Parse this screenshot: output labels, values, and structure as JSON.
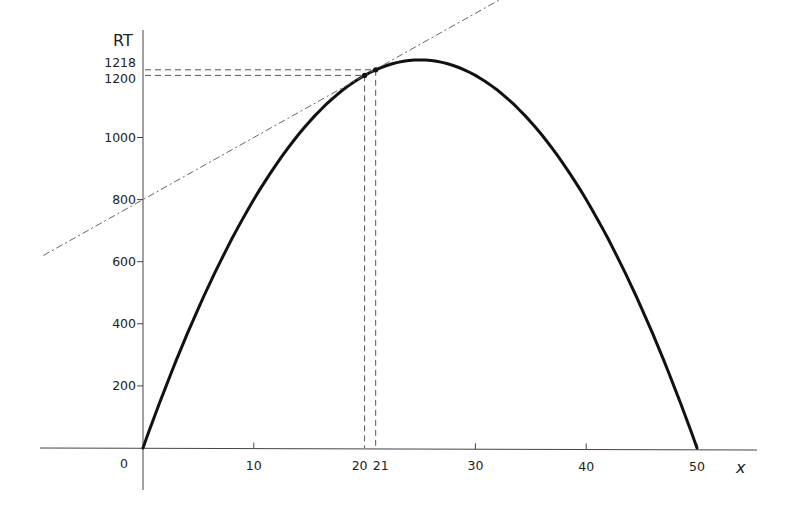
{
  "chart_data": {
    "type": "line",
    "title": "",
    "xlabel": "x",
    "ylabel": "RT",
    "xlim": [
      -9,
      52
    ],
    "ylim": [
      -70,
      1350
    ],
    "grid": false,
    "x_ticks": [
      10,
      20,
      21,
      30,
      40,
      50
    ],
    "x_tick_labels": [
      "10",
      "20",
      "21",
      "30",
      "40",
      "50"
    ],
    "origin_label": "0",
    "y_ticks": [
      200,
      400,
      600,
      800,
      1000,
      1200,
      1218
    ],
    "y_tick_labels": [
      "200",
      "400",
      "600",
      "800",
      "1000",
      "1200",
      "1218"
    ],
    "series": [
      {
        "name": "RT (total revenue)",
        "style": "solid-thick",
        "equation": "RT = 100x - 2x^2",
        "x": [
          0,
          5,
          10,
          15,
          20,
          21,
          25,
          30,
          35,
          40,
          45,
          50
        ],
        "values": [
          0,
          450,
          800,
          1050,
          1200,
          1218,
          1250,
          1200,
          1050,
          800,
          450,
          0
        ]
      },
      {
        "name": "tangent line",
        "style": "dash-dot",
        "equation": "y = 800 + 20x",
        "x": [
          -9,
          0,
          20,
          21,
          33
        ],
        "values": [
          620,
          800,
          1200,
          1220,
          1460
        ]
      }
    ],
    "annotations": [
      {
        "type": "point",
        "x": 20,
        "y": 1200
      },
      {
        "type": "point",
        "x": 21,
        "y": 1218
      },
      {
        "type": "dashed-guide",
        "from": [
          0,
          1200
        ],
        "to": [
          20,
          1200
        ],
        "down_to": [
          20,
          0
        ]
      },
      {
        "type": "dashed-guide",
        "from": [
          0,
          1218
        ],
        "to": [
          21,
          1218
        ],
        "down_to": [
          21,
          0
        ]
      }
    ]
  }
}
